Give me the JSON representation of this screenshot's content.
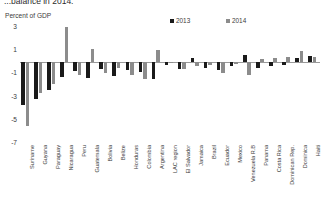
{
  "header": {
    "title": "...balance in 2014:",
    "subtitle": "Percent of GDP"
  },
  "legend": {
    "position": "top-right",
    "items": [
      {
        "label": "2013",
        "color": "#1a1a1a"
      },
      {
        "label": "2014",
        "color": "#8c8c8c"
      }
    ]
  },
  "colors": {
    "series_2013": "#1a1a1a",
    "series_2014": "#8c8c8c",
    "axis": "#9a9a9a",
    "text": "#3b3b3b"
  },
  "chart_data": {
    "type": "bar",
    "title": "...balance in 2014:",
    "xlabel": "",
    "ylabel": "Percent of GDP",
    "ylim": [
      -7,
      3
    ],
    "yticks": [
      3,
      1,
      -1,
      -3,
      -5,
      -7
    ],
    "grid": false,
    "legend_position": "top-right",
    "categories": [
      "Suriname",
      "Guyana",
      "Paraguay",
      "Nicaragua",
      "Peru",
      "Guatemala",
      "Bolivia",
      "Belize",
      "Honduras",
      "Colombia",
      "Argentina",
      "LAC region",
      "El Salvador",
      "Jamaica",
      "Brazil",
      "Ecuador",
      "Mexico",
      "Venezuela R.B",
      "Panama",
      "Costa Rica",
      "Dominican Rep.",
      "Dominica",
      "Haiti"
    ],
    "series": [
      {
        "name": "2013",
        "color": "#1a1a1a",
        "values": [
          -3.7,
          -3.2,
          -2.4,
          -1.3,
          -0.8,
          -1.4,
          -0.6,
          -1.2,
          -0.7,
          -0.9,
          -1.5,
          -0.3,
          -0.6,
          0.3,
          -0.5,
          -0.7,
          -0.4,
          0.6,
          -0.5,
          -0.4,
          -0.3,
          0.3,
          0.5
        ]
      },
      {
        "name": "2014",
        "color": "#8c8c8c",
        "values": [
          -5.5,
          -2.7,
          -1.9,
          3.0,
          -1.1,
          1.1,
          -1.0,
          -0.5,
          -1.1,
          -1.5,
          1.0,
          -0.1,
          -0.6,
          -0.4,
          -0.3,
          -1.0,
          -0.2,
          -1.1,
          0.2,
          0.3,
          0.4,
          0.9,
          0.4
        ]
      }
    ]
  }
}
